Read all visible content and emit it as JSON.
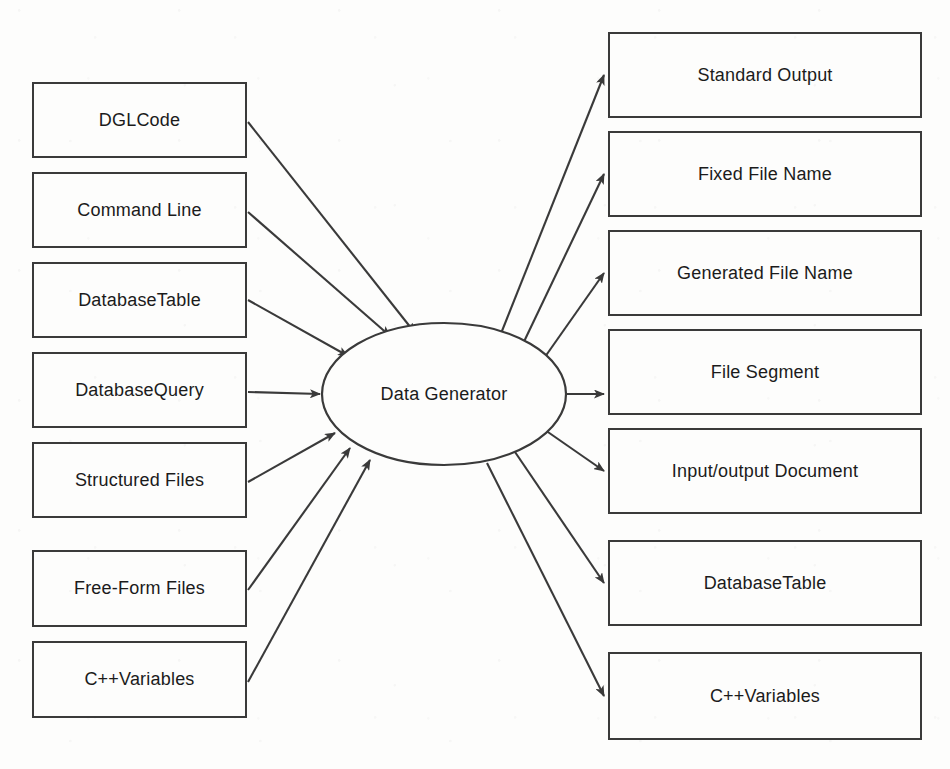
{
  "diagram": {
    "type": "context-data-flow-diagram",
    "process": {
      "label": "Data Generator",
      "shape": "ellipse",
      "cx": 444,
      "cy": 394,
      "rx": 122,
      "ry": 71
    },
    "inputs": [
      {
        "label": "DGLCode",
        "x": 32,
        "y": 82,
        "w": 215,
        "h": 76
      },
      {
        "label": "Command Line",
        "x": 32,
        "y": 172,
        "w": 215,
        "h": 76
      },
      {
        "label": "DatabaseTable",
        "x": 32,
        "y": 262,
        "w": 215,
        "h": 76
      },
      {
        "label": "DatabaseQuery",
        "x": 32,
        "y": 352,
        "w": 215,
        "h": 76
      },
      {
        "label": "Structured Files",
        "x": 32,
        "y": 442,
        "w": 215,
        "h": 76
      },
      {
        "label": "Free-Form Files",
        "x": 32,
        "y": 550,
        "w": 215,
        "h": 77
      },
      {
        "label": "C++Variables",
        "x": 32,
        "y": 641,
        "w": 215,
        "h": 77
      }
    ],
    "outputs": [
      {
        "label": "Standard Output",
        "x": 608,
        "y": 32,
        "w": 314,
        "h": 86
      },
      {
        "label": "Fixed File Name",
        "x": 608,
        "y": 131,
        "w": 314,
        "h": 86
      },
      {
        "label": "Generated File Name",
        "x": 608,
        "y": 230,
        "w": 314,
        "h": 86
      },
      {
        "label": "File Segment",
        "x": 608,
        "y": 329,
        "w": 314,
        "h": 86
      },
      {
        "label": "Input/output  Document",
        "x": 608,
        "y": 428,
        "w": 314,
        "h": 86
      },
      {
        "label": "DatabaseTable",
        "x": 608,
        "y": 540,
        "w": 314,
        "h": 86
      },
      {
        "label": "C++Variables",
        "x": 608,
        "y": 652,
        "w": 314,
        "h": 88
      }
    ],
    "input_flows": [
      {
        "from": "DGLCode",
        "to": "Data Generator",
        "x1": 248,
        "y1": 122,
        "x2": 415,
        "y2": 333
      },
      {
        "from": "Command Line",
        "to": "Data Generator",
        "x1": 248,
        "y1": 212,
        "x2": 390,
        "y2": 336
      },
      {
        "from": "DatabaseTable",
        "to": "Data Generator",
        "x1": 248,
        "y1": 300,
        "x2": 348,
        "y2": 356
      },
      {
        "from": "DatabaseQuery",
        "to": "Data Generator",
        "x1": 248,
        "y1": 392,
        "x2": 320,
        "y2": 394
      },
      {
        "from": "Structured Files",
        "to": "Data Generator",
        "x1": 248,
        "y1": 482,
        "x2": 335,
        "y2": 433
      },
      {
        "from": "Free-Form Files",
        "to": "Data Generator",
        "x1": 248,
        "y1": 590,
        "x2": 350,
        "y2": 448
      },
      {
        "from": "C++Variables",
        "to": "Data Generator",
        "x1": 248,
        "y1": 682,
        "x2": 370,
        "y2": 460
      }
    ],
    "output_flows": [
      {
        "from": "Data Generator",
        "to": "Standard Output",
        "x1": 500,
        "y1": 336,
        "x2": 604,
        "y2": 75
      },
      {
        "from": "Data Generator",
        "to": "Fixed File Name",
        "x1": 520,
        "y1": 350,
        "x2": 604,
        "y2": 174
      },
      {
        "from": "Data Generator",
        "to": "Generated File Name",
        "x1": 540,
        "y1": 364,
        "x2": 604,
        "y2": 273
      },
      {
        "from": "Data Generator",
        "to": "File Segment",
        "x1": 566,
        "y1": 394,
        "x2": 604,
        "y2": 394
      },
      {
        "from": "Data Generator",
        "to": "Input/output  Document",
        "x1": 545,
        "y1": 430,
        "x2": 604,
        "y2": 471
      },
      {
        "from": "Data Generator",
        "to": "DatabaseTable",
        "x1": 515,
        "y1": 452,
        "x2": 604,
        "y2": 583
      },
      {
        "from": "Data Generator",
        "to": "C++Variables",
        "x1": 487,
        "y1": 463,
        "x2": 604,
        "y2": 696
      }
    ],
    "colors": {
      "stroke": "#3a3a3a",
      "text": "#1b1b1b",
      "background": "#fdfdfc"
    }
  }
}
